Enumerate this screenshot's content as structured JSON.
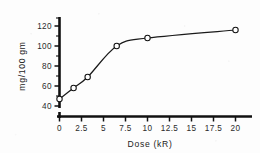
{
  "chart_data": {
    "type": "line",
    "title": "",
    "subtitle": "",
    "xlabel": "Dose (kR)",
    "ylabel": "mg/100 gm",
    "xlim": [
      0,
      21.5
    ],
    "ylim": [
      36,
      128
    ],
    "grid": false,
    "legend": null,
    "marker": "open-circle",
    "x": [
      0,
      1.6,
      3.2,
      6.5,
      10,
      20
    ],
    "values": [
      47,
      58,
      69,
      100,
      108,
      116
    ],
    "series": [
      {
        "name": "dose-response",
        "x": [
          0,
          1.6,
          3.2,
          6.5,
          10,
          20
        ],
        "values": [
          47,
          58,
          69,
          100,
          108,
          116
        ]
      }
    ],
    "xticks": [
      0,
      2.5,
      5,
      7.5,
      10,
      12.5,
      15,
      17.5,
      20
    ],
    "xticklabels": [
      "0",
      "2.5",
      "5",
      "7.5",
      "10",
      "12.5",
      "15",
      "17.5",
      "20"
    ],
    "yticks": [
      40,
      60,
      80,
      100,
      120
    ],
    "yticklabels": [
      "40",
      "60",
      "80",
      "100",
      "120"
    ],
    "yminorticks": [
      50,
      70,
      90,
      110
    ],
    "annotations": []
  },
  "axes": {
    "x": {
      "title": "Dose (kR)",
      "ticks": [
        {
          "value": 0,
          "label": "0"
        },
        {
          "value": 2.5,
          "label": "2.5"
        },
        {
          "value": 5,
          "label": "5"
        },
        {
          "value": 7.5,
          "label": "7.5"
        },
        {
          "value": 10,
          "label": "10"
        },
        {
          "value": 12.5,
          "label": "12.5"
        },
        {
          "value": 15,
          "label": "15"
        },
        {
          "value": 17.5,
          "label": "17.5"
        },
        {
          "value": 20,
          "label": "20"
        }
      ]
    },
    "y": {
      "title": "mg/100 gm",
      "ticks": [
        {
          "value": 120,
          "label": "120"
        },
        {
          "value": 100,
          "label": "100"
        },
        {
          "value": 80,
          "label": "80"
        },
        {
          "value": 60,
          "label": "60"
        },
        {
          "value": 40,
          "label": "40"
        }
      ]
    }
  },
  "colors": {
    "axis": "#111111",
    "curve": "#1a1a1a",
    "marker_fill": "#ffffff",
    "marker_stroke": "#111111",
    "text": "#232323",
    "background": "#fdfdfd"
  }
}
